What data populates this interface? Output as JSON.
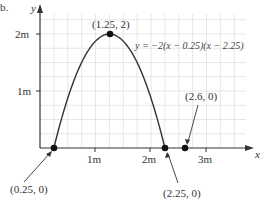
{
  "corner_label": "b.",
  "chart_data": {
    "type": "line",
    "title": "",
    "xlabel": "x",
    "ylabel": "y",
    "equation": "y = −2(x − 0.25)(x − 2.25)",
    "x_ticks": [
      "1m",
      "2m",
      "3m"
    ],
    "y_ticks": [
      "1m",
      "2m"
    ],
    "xlim": [
      0,
      3.6
    ],
    "ylim": [
      0,
      2.5
    ],
    "grid": true,
    "grid_step": 0.25,
    "series": [
      {
        "name": "y = −2(x − 0.25)(x − 2.25)",
        "x": [
          0.25,
          0.5,
          0.75,
          1.0,
          1.25,
          1.5,
          1.75,
          2.0,
          2.25
        ],
        "values": [
          0,
          0.875,
          1.5,
          1.875,
          2,
          1.875,
          1.5,
          0.875,
          0
        ]
      }
    ],
    "points": [
      {
        "label": "(1.25, 2)",
        "x": 1.25,
        "y": 2
      },
      {
        "label": "(0.25, 0)",
        "x": 0.25,
        "y": 0
      },
      {
        "label": "(2.25, 0)",
        "x": 2.25,
        "y": 0
      },
      {
        "label": "(2.6, 0)",
        "x": 2.6,
        "y": 0
      }
    ]
  }
}
